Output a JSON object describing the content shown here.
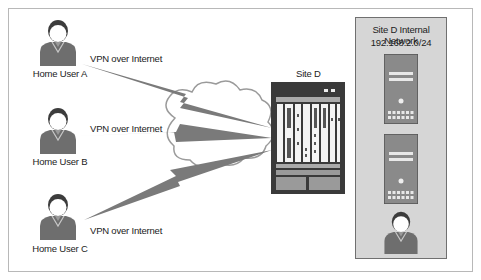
{
  "diagram": {
    "users": [
      {
        "name": "Home User A",
        "link_label": "VPN over Internet"
      },
      {
        "name": "Home User B",
        "link_label": "VPN over Internet"
      },
      {
        "name": "Home User C",
        "link_label": "VPN over Internet"
      }
    ],
    "site": {
      "name": "Site D"
    },
    "internal_network": {
      "title": "Site D Internal Network",
      "subnet": "192.168.2.0/24",
      "servers": 2,
      "users": 1
    },
    "colors": {
      "person_body": "#6e6e6e",
      "person_hair": "#3c3c3c",
      "link": "#7a7a7a",
      "router_frame": "#3a3a3a",
      "panel_bg": "#d6d6d6",
      "server_body": "#8a8a8a"
    }
  }
}
